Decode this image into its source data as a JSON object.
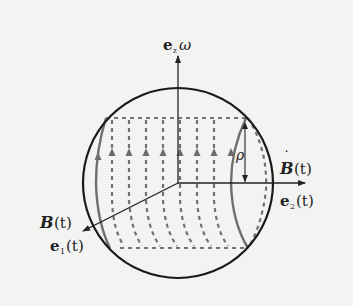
{
  "diagram": {
    "title": "",
    "labels": {
      "z_axis": {
        "vector": "e",
        "sub": "z",
        "factor": "ω"
      },
      "b_dot": {
        "vector": "B",
        "arg": "(t)",
        "dot": "˙"
      },
      "e2": {
        "vector": "e",
        "sub": "2",
        "arg": "(t)"
      },
      "b": {
        "vector": "B",
        "arg": "(t)"
      },
      "e1": {
        "vector": "e",
        "sub": "1",
        "arg": "(t)"
      },
      "rho": "ρ"
    },
    "colors": {
      "background": "#f3f3f2",
      "sphere": "#1a1a1a",
      "axes": "#222222",
      "field_lines": "#707070"
    },
    "elements": [
      "sphere-outline",
      "z-axis-arrow",
      "e2-axis-arrow",
      "e1-axis-arrow",
      "dashed-field-lines",
      "cylinder-end-ellipse",
      "rho-arrow"
    ]
  }
}
